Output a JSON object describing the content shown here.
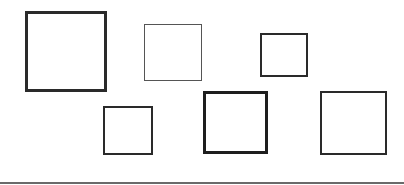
{
  "diagram": {
    "background": "#ffffff",
    "squares": [
      {
        "id": "square-1",
        "x": 25,
        "y": 11,
        "w": 82,
        "h": 81,
        "stroke": 3,
        "color": "#2a2a2a"
      },
      {
        "id": "square-2",
        "x": 144,
        "y": 24,
        "w": 58,
        "h": 57,
        "stroke": 1.5,
        "color": "#555555"
      },
      {
        "id": "square-3",
        "x": 260,
        "y": 33,
        "w": 48,
        "h": 44,
        "stroke": 2,
        "color": "#2a2a2a"
      },
      {
        "id": "square-4",
        "x": 103,
        "y": 106,
        "w": 50,
        "h": 49,
        "stroke": 2,
        "color": "#2a2a2a"
      },
      {
        "id": "square-5",
        "x": 203,
        "y": 91,
        "w": 65,
        "h": 63,
        "stroke": 3.5,
        "color": "#1e1e1e"
      },
      {
        "id": "square-6",
        "x": 320,
        "y": 91,
        "w": 67,
        "h": 64,
        "stroke": 2,
        "color": "#2a2a2a"
      }
    ],
    "baseline": {
      "y": 182,
      "width": 404,
      "color": "#6a6a6a"
    }
  }
}
